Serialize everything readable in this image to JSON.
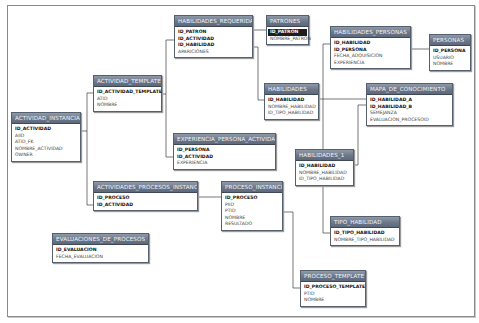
{
  "diagram": {
    "type": "database-schema",
    "tables": [
      {
        "name": "ACTIVIDAD_INSTANCIA",
        "fields": [
          {
            "label": "ID_ACTIVIDAD",
            "pk": true
          },
          {
            "label": "AIID"
          },
          {
            "label": "ATID_FK"
          },
          {
            "label": "NOMBRE_ACTIVIDAD"
          },
          {
            "label": "OWNER"
          }
        ]
      },
      {
        "name": "ACTIVIDAD_TEMPLATE",
        "fields": [
          {
            "label": "ID_ACTIVIDAD_TEMPLATE",
            "pk": true
          },
          {
            "label": "ATID"
          },
          {
            "label": "NOMBRE"
          }
        ]
      },
      {
        "name": "HABILIDADES_REQUERIDAS",
        "fields": [
          {
            "label": "ID_PATRON",
            "pk": true
          },
          {
            "label": "ID_ACTIVIDAD",
            "pk": true
          },
          {
            "label": "ID_HABILIDAD",
            "pk": true
          },
          {
            "label": "APARICIONES"
          }
        ]
      },
      {
        "name": "PATRONES",
        "fields": [
          {
            "label": "ID_PATRON",
            "pk": true,
            "selected": true
          },
          {
            "label": "NOMBRE_PATRON"
          }
        ]
      },
      {
        "name": "HABILIDADES_PERSONAS",
        "fields": [
          {
            "label": "ID_HABILIDAD",
            "pk": true
          },
          {
            "label": "ID_PERSONA",
            "pk": true
          },
          {
            "label": "FECHA_ADQUISICION"
          },
          {
            "label": "EXPERIENCIA"
          }
        ]
      },
      {
        "name": "PERSONAS",
        "fields": [
          {
            "label": "ID_PERSONA",
            "pk": true
          },
          {
            "label": "USUARIO"
          },
          {
            "label": "NOMBRE"
          }
        ]
      },
      {
        "name": "HABILIDADES",
        "fields": [
          {
            "label": "ID_HABILIDAD",
            "pk": true
          },
          {
            "label": "NOMBRE_HABILIDAD"
          },
          {
            "label": "ID_TIPO_HABILIDAD"
          }
        ]
      },
      {
        "name": "MAPA_DE_CONOCIMIENTO",
        "fields": [
          {
            "label": "ID_HABILIDAD_A",
            "pk": true
          },
          {
            "label": "ID_HABILIDAD_B",
            "pk": true
          },
          {
            "label": "SEMEJANZA"
          },
          {
            "label": "EVALUACION_PROCESOID"
          }
        ]
      },
      {
        "name": "EXPERIENCIA_PERSONA_ACTIVIDAD",
        "fields": [
          {
            "label": "ID_PERSONA",
            "pk": true
          },
          {
            "label": "ID_ACTIVIDAD",
            "pk": true
          },
          {
            "label": "EXPERIENCIA"
          }
        ]
      },
      {
        "name": "HABILIDADES_1",
        "fields": [
          {
            "label": "ID_HABILIDAD",
            "pk": true
          },
          {
            "label": "NOMBRE_HABILIDAD"
          },
          {
            "label": "ID_TIPO_HABILIDAD"
          }
        ]
      },
      {
        "name": "ACTIVIDADES_PROCESOS_INSTANCIA",
        "fields": [
          {
            "label": "ID_PROCESO",
            "pk": true
          },
          {
            "label": "ID_ACTIVIDAD",
            "pk": true
          }
        ]
      },
      {
        "name": "PROCESO_INSTANCIA",
        "fields": [
          {
            "label": "ID_PROCESO",
            "pk": true
          },
          {
            "label": "PIID"
          },
          {
            "label": "PTID"
          },
          {
            "label": "NOMBRE"
          },
          {
            "label": "RESULTADO"
          }
        ]
      },
      {
        "name": "EVALUACIONES_DE_PROCESOS",
        "fields": [
          {
            "label": "ID_EVALUACION",
            "pk": true
          },
          {
            "label": "FECHA_EVALUACION"
          }
        ]
      },
      {
        "name": "TIPO_HABILIDAD",
        "fields": [
          {
            "label": "ID_TIPO_HABILIDAD",
            "pk": true
          },
          {
            "label": "NOMBRE_TIPO_HABILIDAD"
          }
        ]
      },
      {
        "name": "PROCESO_TEMPLATE",
        "fields": [
          {
            "label": "ID_PROCESO_TEMPLATE",
            "pk": true
          },
          {
            "label": "PTID"
          },
          {
            "label": "NOMBRE"
          }
        ]
      }
    ],
    "relationships": [
      {
        "from": "ACTIVIDAD_INSTANCIA",
        "to": "ACTIVIDAD_TEMPLATE"
      },
      {
        "from": "ACTIVIDAD_INSTANCIA",
        "to": "ACTIVIDADES_PROCESOS_INSTANCIA"
      },
      {
        "from": "ACTIVIDAD_TEMPLATE",
        "to": "HABILIDADES_REQUERIDAS"
      },
      {
        "from": "ACTIVIDAD_TEMPLATE",
        "to": "EXPERIENCIA_PERSONA_ACTIVIDAD"
      },
      {
        "from": "HABILIDADES_REQUERIDAS",
        "to": "PATRONES"
      },
      {
        "from": "HABILIDADES_REQUERIDAS",
        "to": "HABILIDADES"
      },
      {
        "from": "HABILIDADES_PERSONAS",
        "to": "PERSONAS"
      },
      {
        "from": "HABILIDADES_PERSONAS",
        "to": "HABILIDADES_1"
      },
      {
        "from": "HABILIDADES",
        "to": "MAPA_DE_CONOCIMIENTO"
      },
      {
        "from": "HABILIDADES_1",
        "to": "MAPA_DE_CONOCIMIENTO"
      },
      {
        "from": "HABILIDADES_1",
        "to": "TIPO_HABILIDAD"
      },
      {
        "from": "ACTIVIDADES_PROCESOS_INSTANCIA",
        "to": "PROCESO_INSTANCIA"
      },
      {
        "from": "PROCESO_INSTANCIA",
        "to": "PROCESO_TEMPLATE"
      }
    ]
  }
}
